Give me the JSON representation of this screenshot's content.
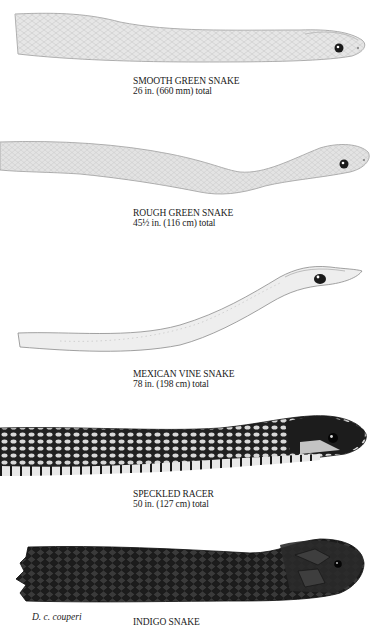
{
  "page": {
    "type": "field-guide plate",
    "background": "#ffffff"
  },
  "plates": [
    {
      "id": "smooth-green-snake",
      "common_name": "SMOOTH GREEN SNAKE",
      "size": "26 in. (660 mm) total",
      "tone": "#e6e6e6",
      "outline": "#9a9a9a"
    },
    {
      "id": "rough-green-snake",
      "common_name": "ROUGH GREEN SNAKE",
      "size": "45½ in. (116 cm) total",
      "tone": "#e3e3e3",
      "outline": "#9a9a9a"
    },
    {
      "id": "mexican-vine-snake",
      "common_name": "MEXICAN VINE SNAKE",
      "size": "78 in. (198 cm) total",
      "tone": "#eeeeee",
      "outline": "#8a8a8a"
    },
    {
      "id": "speckled-racer",
      "common_name": "SPECKLED RACER",
      "size": "50 in. (127 cm) total",
      "tone": "#2a2a2a",
      "outline": "#111111"
    },
    {
      "id": "indigo-snake",
      "common_name": "INDIGO SNAKE",
      "subspecies_label": "D. c. couperi",
      "tone": "#1e1e1e",
      "outline": "#0a0a0a"
    }
  ]
}
